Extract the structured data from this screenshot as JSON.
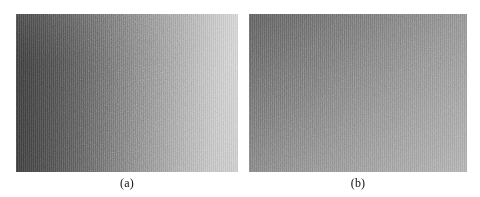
{
  "figure": {
    "background_color": "#ffffff",
    "panel_count": 2,
    "panels": [
      {
        "id": "a",
        "caption": "(a)",
        "kind": "grayscale-image",
        "description": "Noisy grayscale image with strong diagonal illumination gradient, dark at lower-left and bright toward the right edge",
        "gradient_direction": "lower-left to right",
        "dark_value": "#343434",
        "light_value": "#dcdcdc",
        "noise": "heavy film grain"
      },
      {
        "id": "b",
        "caption": "(b)",
        "kind": "grayscale-image",
        "description": "Noisy grayscale image with flat low-contrast diagonal gradient, mid-gray throughout",
        "gradient_direction": "top-left to bottom-right",
        "dark_value": "#5f5f5f",
        "light_value": "#b2b2b2",
        "noise": "moderate film grain"
      }
    ]
  }
}
